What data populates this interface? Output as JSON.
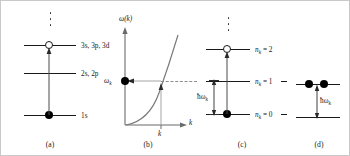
{
  "figure": {
    "background_color": "#ffffff",
    "line_color": "#1a1a1a",
    "axis_color": "#6b6b6b",
    "dash_color": "#8d8d8d"
  },
  "panels": [
    {
      "id": "a",
      "caption": "(a)",
      "type": "atomic-energy-levels",
      "levels": [
        {
          "label": "3s, 3p, 3d",
          "marker": "open-circle"
        },
        {
          "label": "2s, 2p",
          "marker": "none"
        },
        {
          "label": "1s",
          "marker": "filled-circle"
        }
      ],
      "ellipsis": "vertical-dots",
      "transition_arrow": "upward from 1s to 3s,3p,3d"
    },
    {
      "id": "b",
      "caption": "(b)",
      "type": "dispersion-plot",
      "yaxis_label": "ω(k)",
      "xaxis_label": "k",
      "marked_frequency": "ω",
      "marked_frequency_sub": "k",
      "marked_wavevector": "k",
      "curve": "monotonically increasing ω(k) from origin",
      "marker": "filled-circle on ω-axis at ω_k",
      "arrow_left_label": "",
      "arrow_up_label": ""
    },
    {
      "id": "c",
      "caption": "(c)",
      "type": "phonon-number-levels",
      "levels": [
        {
          "label_main": "n",
          "label_sub": "k",
          "label_eq": " = 2",
          "marker": "open-circle"
        },
        {
          "label_main": "n",
          "label_sub": "k",
          "label_eq": " = 1",
          "marker": "none"
        },
        {
          "label_main": "n",
          "label_sub": "k",
          "label_eq": " = 0",
          "marker": "filled-circle"
        }
      ],
      "ellipsis": "vertical-dots",
      "energy_gap_label_main": "ħω",
      "energy_gap_label_sub": "k",
      "transition_arrow": "upward from n_k = 0 to n_k = 2"
    },
    {
      "id": "d",
      "caption": "(d)",
      "type": "two-particle-excitation",
      "upper_level_markers": [
        "filled-circle",
        "filled-circle"
      ],
      "lower_level_markers": [],
      "energy_gap_label_main": "ħω",
      "energy_gap_label_sub": "k",
      "transition_arrow": "upward from lower level to upper level"
    }
  ]
}
